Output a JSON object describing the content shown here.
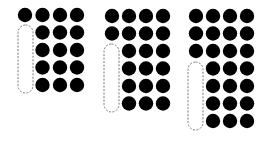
{
  "diagram": {
    "colors": {
      "dot": "#000000",
      "outline": "#777777",
      "background": "#ffffff"
    },
    "dot_radius": 7.2,
    "groups": [
      {
        "id": "group-1",
        "columns_x": [
          25,
          42.5,
          60,
          77
        ],
        "rows_y": [
          15,
          32.5,
          50,
          67.5,
          85
        ],
        "full_rows": 1,
        "pill": {
          "x": 18,
          "y": 25,
          "w": 15,
          "h": 68
        }
      },
      {
        "id": "group-2",
        "columns_x": [
          112,
          129,
          146,
          163
        ],
        "rows_y": [
          16,
          33.5,
          51,
          68.5,
          86,
          103.5
        ],
        "full_rows": 2,
        "pill": {
          "x": 104,
          "y": 44,
          "w": 15,
          "h": 68
        }
      },
      {
        "id": "group-3",
        "columns_x": [
          196,
          213,
          230,
          247
        ],
        "rows_y": [
          16,
          33.5,
          51,
          68.5,
          86,
          103.5,
          121
        ],
        "full_rows": 3,
        "pill": {
          "x": 188,
          "y": 62,
          "w": 15,
          "h": 68
        }
      }
    ]
  }
}
